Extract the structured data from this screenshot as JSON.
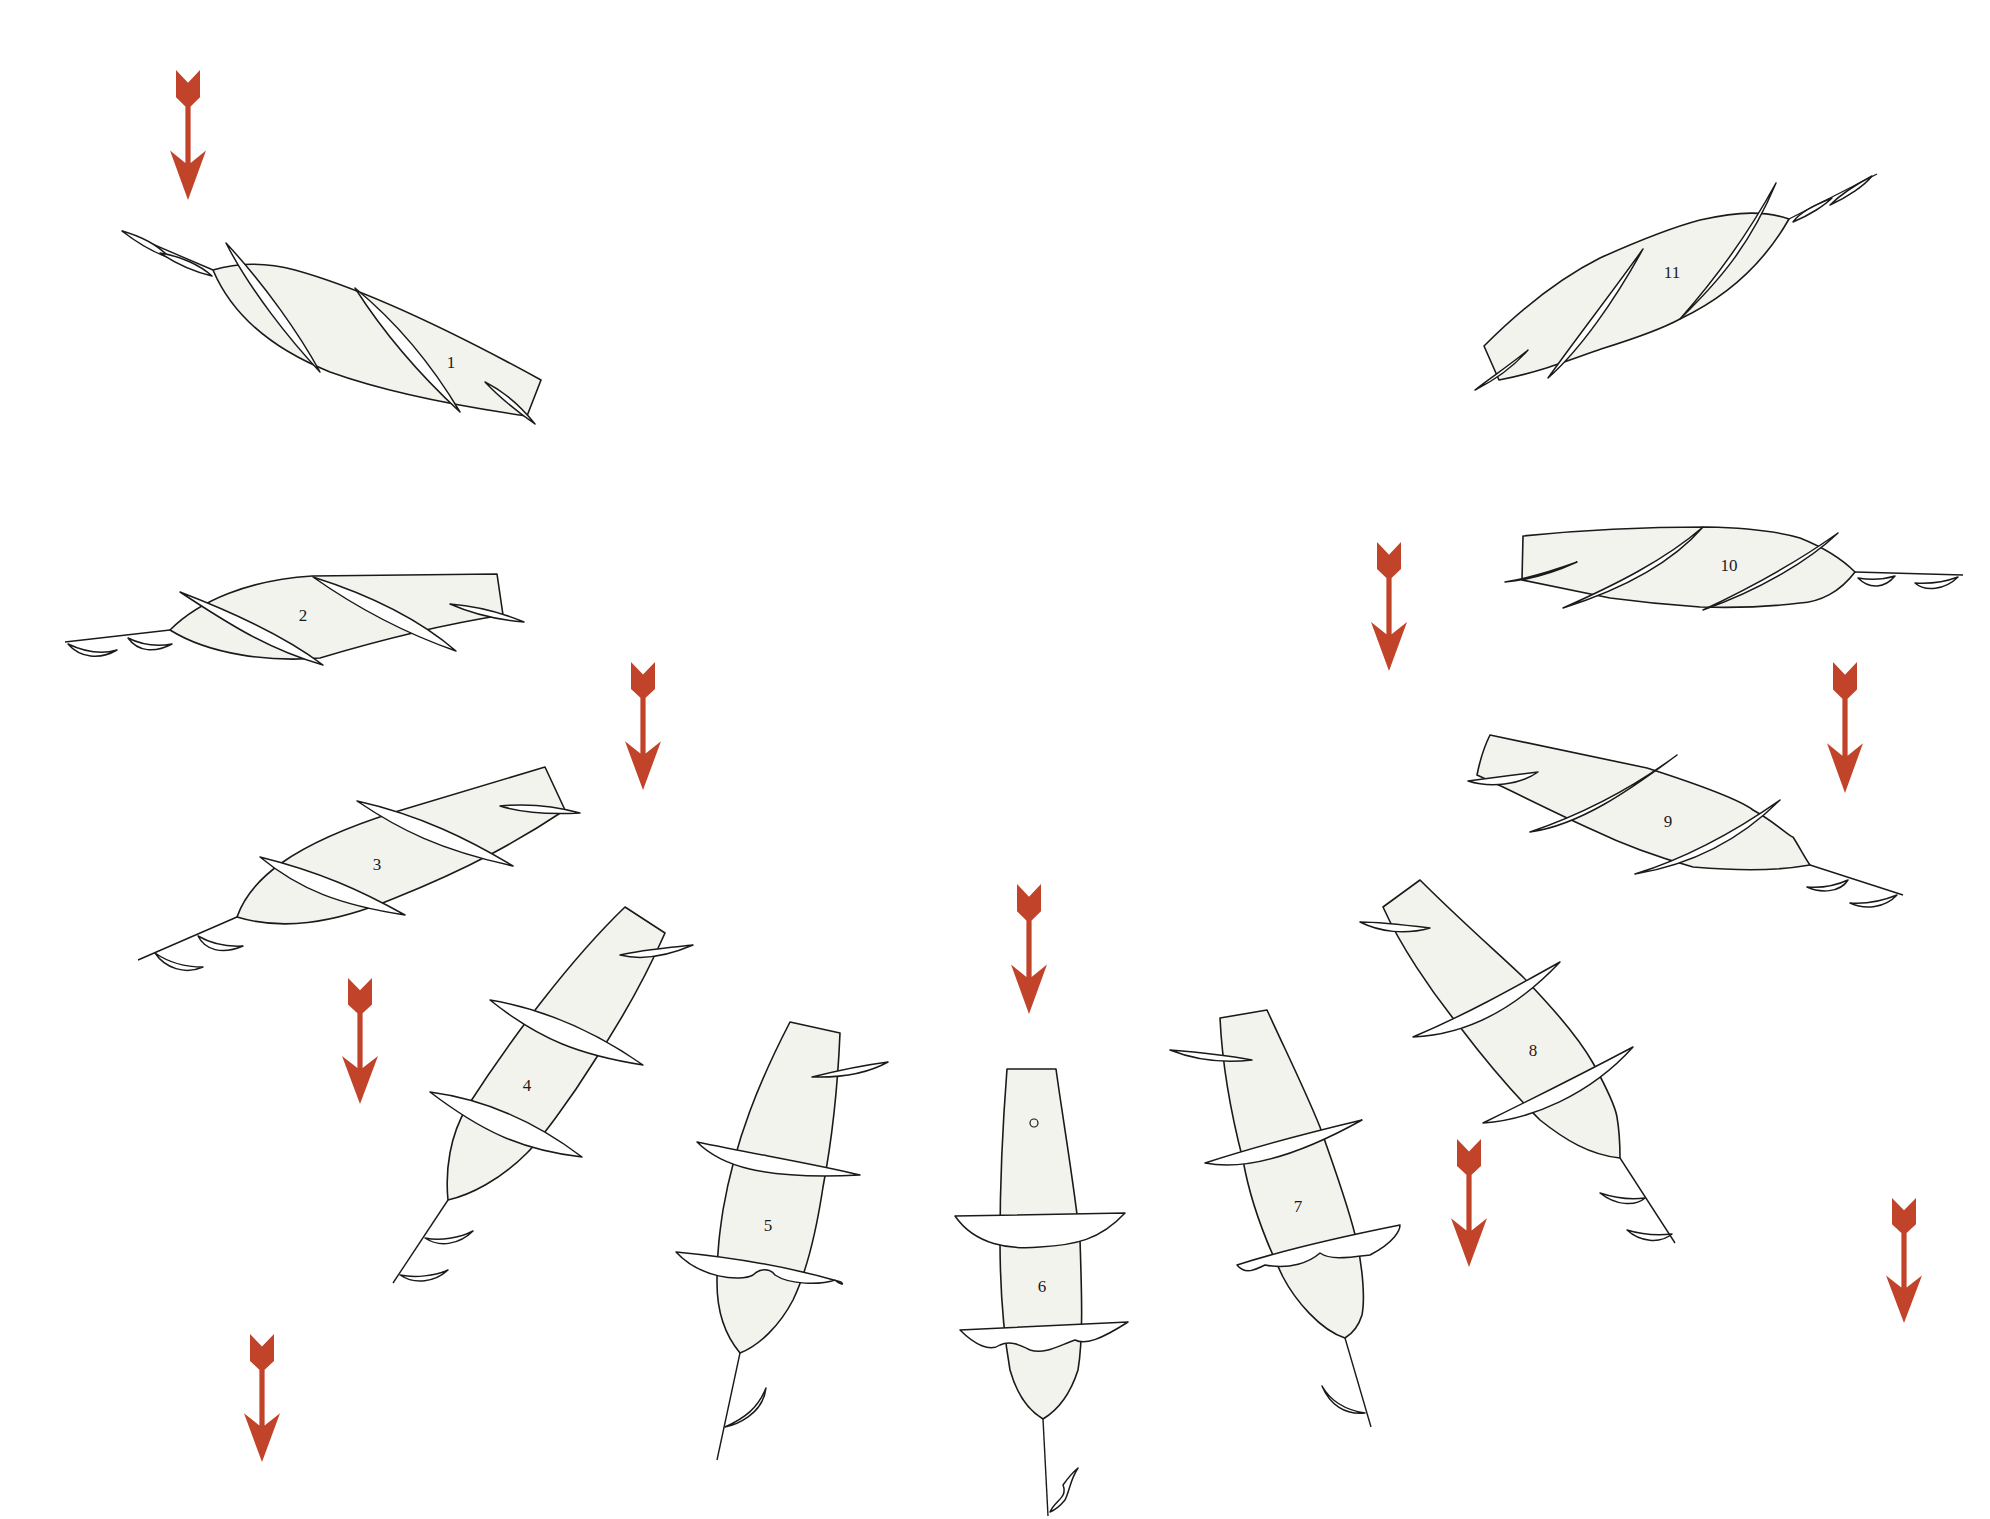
{
  "figure": {
    "colors": {
      "background": "#ffffff",
      "body_fill": "#f3f3ee",
      "outline": "#1a1a1a",
      "arrow": "#c1432a"
    },
    "arrows": [
      {
        "id": "arrow-1",
        "x": 188,
        "y1": 70,
        "y2": 200
      },
      {
        "id": "arrow-2",
        "x": 643,
        "y1": 662,
        "y2": 790
      },
      {
        "id": "arrow-3",
        "x": 360,
        "y1": 978,
        "y2": 1104
      },
      {
        "id": "arrow-4",
        "x": 1029,
        "y1": 884,
        "y2": 1014
      },
      {
        "id": "arrow-5",
        "x": 262,
        "y1": 1334,
        "y2": 1462
      },
      {
        "id": "arrow-6",
        "x": 1389,
        "y1": 542,
        "y2": 671
      },
      {
        "id": "arrow-7",
        "x": 1845,
        "y1": 662,
        "y2": 793
      },
      {
        "id": "arrow-8",
        "x": 1469,
        "y1": 1139,
        "y2": 1267
      },
      {
        "id": "arrow-9",
        "x": 1904,
        "y1": 1198,
        "y2": 1323
      }
    ],
    "bodies": [
      {
        "label": "1",
        "lx": 451,
        "ly": 364,
        "outline": "M213,270 C240,262 265,262 295,270 C360,288 450,330 541,380 L527,416 C450,405 380,390 330,372 C270,348 232,315 213,270 Z",
        "fins": [
          "M226,243 C250,290 290,340 320,372 C300,335 265,285 226,243 Z",
          "M355,288 C385,335 420,375 460,412 C435,370 400,325 355,288 Z",
          "M485,382 C500,398 515,410 535,424 C520,405 505,392 485,382 Z"
        ],
        "shaft": "M213,270 L122,231",
        "tail_fins": [
          "M122,231 C140,245 155,253 170,258 C158,245 140,236 122,231 Z",
          "M160,253 C178,265 195,272 212,276 C200,265 180,256 160,253 Z"
        ]
      },
      {
        "label": "2",
        "lx": 303,
        "ly": 617,
        "outline": "M170,630 C200,600 250,580 312,576 L497,574 L503,615 C440,625 380,640 320,658 C270,662 210,655 170,630 Z",
        "fins": [
          "M180,592 C230,625 270,650 323,665 C290,640 240,615 180,592 Z",
          "M313,577 C360,610 410,635 456,651 C420,620 370,595 313,577 Z",
          "M450,604 C475,615 500,620 524,622 C500,612 475,606 450,604 Z"
        ],
        "shaft": "M170,630 L65,642",
        "tail_fins": [
          "M68,644 C80,658 100,660 117,650 C100,655 85,652 68,644 Z",
          "M128,638 C138,652 155,653 172,644 C155,647 142,645 128,638 Z"
        ]
      },
      {
        "label": "3",
        "lx": 377,
        "ly": 866,
        "outline": "M237,917 C250,880 290,845 395,812 L545,767 L565,810 C520,840 470,868 395,898 C330,925 280,930 237,917 Z",
        "fins": [
          "M260,857 C300,890 340,905 405,915 C360,890 320,872 260,857 Z",
          "M357,801 C400,830 440,850 513,866 C470,840 420,815 357,801 Z",
          "M500,806 C520,812 545,815 580,813 C555,806 530,803 500,806 Z"
        ],
        "shaft": "M237,917 L138,960",
        "tail_fins": [
          "M155,953 C165,968 185,975 203,967 C185,967 168,962 155,953 Z",
          "M198,936 C205,950 222,955 243,946 C225,947 210,943 198,936 Z"
        ]
      },
      {
        "label": "4",
        "lx": 527,
        "ly": 1087,
        "outline": "M625,907 L665,933 C640,990 615,1030 593,1063 C570,1100 540,1140 527,1153 C500,1180 470,1195 448,1200 C445,1170 450,1135 467,1107 C510,1040 570,960 625,907 Z",
        "fins": [
          "M490,1000 C540,1040 580,1055 643,1065 C600,1035 550,1010 490,1000 Z",
          "M430,1092 C480,1130 520,1150 582,1157 C540,1125 490,1100 430,1092 Z",
          "M620,955 C640,960 665,957 693,945 C665,948 640,950 620,955 Z"
        ],
        "shaft": "M448,1200 L393,1283",
        "tail_fins": [
          "M425,1238 C440,1248 460,1244 473,1231 C460,1238 440,1241 425,1238 Z",
          "M400,1275 C415,1285 435,1282 448,1270 C435,1276 415,1278 400,1275 Z"
        ]
      },
      {
        "label": "5",
        "lx": 768,
        "ly": 1227,
        "outline": "M790,1022 L840,1033 C838,1080 832,1140 823,1187 C815,1240 805,1275 793,1300 C780,1325 760,1345 740,1353 C725,1335 717,1310 717,1283 C717,1250 720,1230 723,1210 C735,1140 760,1080 790,1022 Z",
        "fins": [
          "M697,1142 C720,1165 760,1180 860,1175 C820,1165 760,1155 697,1142 Z",
          "M676,1252 C700,1278 740,1282 753,1275 C760,1268 770,1268 775,1275 C790,1285 820,1285 835,1280 C840,1285 845,1285 841,1282 C800,1270 740,1258 676,1252 Z",
          "M812,1077 C840,1070 865,1065 888,1062 C870,1072 845,1078 812,1077 Z"
        ],
        "shaft": "M740,1353 L717,1460",
        "tail_fins": [
          "M725,1427 C735,1425 763,1415 766,1388 C758,1408 745,1418 725,1427 Z"
        ]
      },
      {
        "label": "6",
        "lx": 1042,
        "ly": 1288,
        "outline": "M1007,1069 L1056,1069 C1063,1120 1075,1190 1080,1240 C1082,1300 1083,1340 1078,1370 C1070,1395 1058,1410 1043,1419 C1028,1410 1017,1395 1010,1370 C1003,1330 1000,1290 1000,1240 C1000,1190 1003,1120 1007,1069 Z",
        "fins": [
          "M955,1216 C975,1245 1010,1250 1040,1247 C1075,1245 1100,1240 1125,1213 Z",
          "M960,1330 C975,1345 990,1352 1000,1345 C1010,1340 1020,1345 1030,1350 C1045,1355 1060,1345 1075,1340 C1085,1345 1100,1340 1128,1322 Z"
        ],
        "dot": {
          "cx": 1034,
          "cy": 1123,
          "r": 4
        },
        "shaft": "M1043,1419 L1048,1516",
        "tail_fins": [
          "M1050,1512 C1055,1500 1068,1498 1063,1485 C1068,1478 1072,1473 1078,1468 C1070,1480 1070,1490 1065,1500 C1060,1506 1055,1510 1050,1512 Z"
        ]
      },
      {
        "label": "7",
        "lx": 1298,
        "ly": 1208,
        "outline": "M1220,1018 L1267,1010 C1290,1060 1305,1090 1320,1127 C1335,1170 1350,1210 1357,1243 C1363,1270 1365,1300 1362,1315 C1358,1328 1350,1335 1345,1338 C1320,1330 1295,1300 1283,1277 C1265,1240 1250,1200 1243,1160 C1230,1110 1222,1060 1220,1018 Z",
        "fins": [
          "M1205,1163 C1240,1170 1290,1160 1362,1120 C1320,1130 1260,1145 1205,1163 Z",
          "M1237,1265 C1245,1275 1255,1270 1265,1265 C1290,1270 1310,1262 1320,1253 C1330,1260 1345,1258 1370,1255 C1395,1242 1400,1230 1400,1225 C1350,1235 1290,1248 1237,1265 Z",
          "M1170,1050 C1195,1060 1225,1063 1252,1060 C1225,1055 1195,1052 1170,1050 Z"
        ],
        "shaft": "M1345,1338 L1371,1427",
        "tail_fins": [
          "M1322,1386 C1330,1405 1345,1415 1365,1413 C1345,1410 1330,1400 1322,1386 Z"
        ]
      },
      {
        "label": "8",
        "lx": 1533,
        "ly": 1052,
        "outline": "M1383,907 L1420,880 C1460,920 1500,955 1523,977 C1555,1010 1580,1040 1593,1063 C1605,1085 1615,1105 1617,1117 C1620,1135 1620,1150 1620,1158 C1590,1155 1565,1140 1540,1120 C1510,1090 1485,1060 1460,1027 C1430,990 1400,945 1383,907 Z",
        "fins": [
          "M1413,1037 C1460,1035 1510,1015 1560,962 C1510,990 1465,1015 1413,1037 Z",
          "M1483,1123 C1530,1120 1590,1095 1633,1047 C1580,1075 1530,1100 1483,1123 Z",
          "M1360,922 C1380,932 1405,935 1430,928 C1405,925 1380,922 1360,922 Z"
        ],
        "shaft": "M1620,1158 L1675,1243",
        "tail_fins": [
          "M1600,1193 C1615,1205 1635,1207 1645,1198 C1630,1200 1615,1198 1600,1193 Z",
          "M1627,1230 C1640,1242 1660,1244 1672,1234 C1655,1236 1640,1234 1627,1230 Z"
        ]
      },
      {
        "label": "9",
        "lx": 1668,
        "ly": 823,
        "outline": "M1490,735 C1560,750 1610,760 1647,768 C1700,785 1740,800 1753,810 C1775,822 1790,837 1793,837 C1800,848 1805,858 1810,865 C1770,872 1730,870 1693,867 C1650,855 1620,843 1593,830 C1560,815 1530,800 1503,787 L1477,775 C1480,760 1485,745 1490,735 Z",
        "fins": [
          "M1530,832 C1580,825 1630,790 1677,755 C1630,790 1580,815 1530,832 Z",
          "M1635,874 C1690,865 1740,840 1780,800 C1730,835 1680,860 1635,874 Z",
          "M1468,781 C1490,788 1520,785 1538,772 C1515,775 1490,778 1468,781 Z"
        ],
        "shaft": "M1810,865 L1903,895",
        "tail_fins": [
          "M1807,887 C1820,893 1840,893 1848,880 C1835,886 1820,888 1807,887 Z",
          "M1850,903 C1865,910 1885,908 1897,895 C1880,902 1865,904 1850,903 Z"
        ]
      },
      {
        "label": "10",
        "lx": 1729,
        "ly": 567,
        "outline": "M1523,536 C1600,528 1660,527 1707,527 C1750,528 1780,532 1800,538 C1830,550 1845,562 1855,572 C1840,592 1820,602 1800,603 C1760,608 1730,608 1700,607 C1670,605 1640,602 1610,598 L1522,580 Z",
        "fins": [
          "M1505,582 C1530,580 1555,572 1577,562 C1555,570 1530,578 1505,582 Z",
          "M1563,608 C1620,590 1670,565 1703,527 C1665,560 1615,585 1563,608 Z",
          "M1703,610 C1760,590 1810,560 1838,533 C1800,560 1750,588 1703,610 Z"
        ],
        "shaft": "M1855,572 L1963,575",
        "tail_fins": [
          "M1858,578 C1870,590 1885,588 1895,576 C1882,580 1870,580 1858,578 Z",
          "M1915,583 C1925,592 1945,590 1958,577 C1942,583 1930,584 1915,583 Z"
        ]
      },
      {
        "label": "11",
        "lx": 1672,
        "ly": 274,
        "outline": "M1789,219 C1765,211 1741,211 1700,220 C1670,228 1640,240 1600,258 C1560,278 1520,310 1484,346 L1499,380 C1540,372 1570,360 1601,349 C1630,340 1660,330 1680,319 C1720,300 1760,270 1789,219 Z",
        "fins": [
          "M1548,378 C1580,350 1615,300 1643,249 C1610,295 1575,340 1548,378 Z",
          "M1680,319 C1720,280 1750,245 1776,183 C1745,240 1710,285 1680,319 Z",
          "M1475,390 C1495,380 1515,365 1528,350 C1510,365 1490,378 1475,390 Z"
        ],
        "shaft": "M1789,219 L1877,174",
        "tail_fins": [
          "M1793,222 C1810,215 1825,205 1832,198 C1815,205 1800,212 1793,222 Z",
          "M1830,205 C1848,197 1865,185 1872,176 C1855,185 1840,195 1830,205 Z"
        ]
      }
    ]
  }
}
